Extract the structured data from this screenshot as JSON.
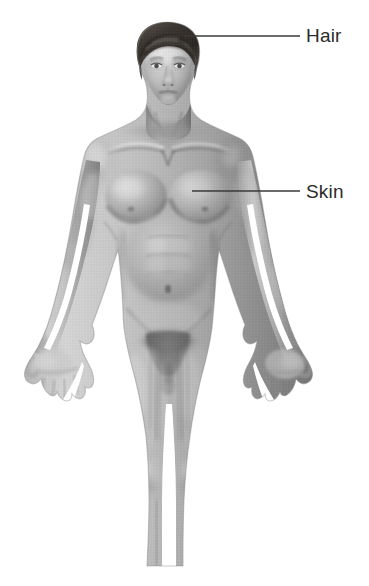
{
  "figure": {
    "kind": "anatomical-illustration",
    "background_color": "#ffffff",
    "skin_tone_color": "#a8a8a8",
    "skin_shadow_color": "#6f6f6f",
    "skin_highlight_color": "#e2e2e2",
    "hair_color": "#3a3632",
    "outline_color": "#7a7a7a"
  },
  "callouts": [
    {
      "id": "hair",
      "label": "Hair",
      "text_color": "#2b2b2b",
      "leader_color": "#3a3a3a",
      "leader_start": {
        "x": 184,
        "y": 36
      },
      "leader_end": {
        "x": 300,
        "y": 36
      },
      "label_position": {
        "x": 306,
        "y": 26
      }
    },
    {
      "id": "skin",
      "label": "Skin",
      "text_color": "#2b2b2b",
      "leader_color": "#3a3a3a",
      "leader_start": {
        "x": 192,
        "y": 191
      },
      "leader_end": {
        "x": 300,
        "y": 191
      },
      "label_position": {
        "x": 306,
        "y": 182
      }
    }
  ],
  "canvas": {
    "width": 369,
    "height": 586
  }
}
